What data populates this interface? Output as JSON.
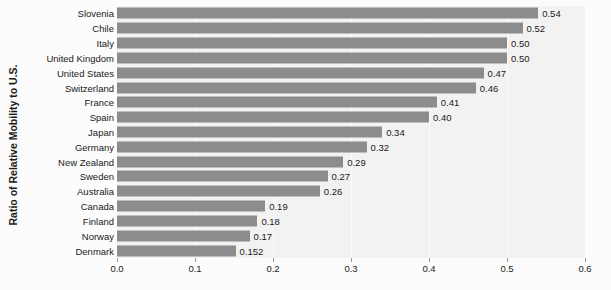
{
  "chart_data": {
    "type": "bar",
    "orientation": "horizontal",
    "title": "",
    "xlabel": "",
    "ylabel": "Ratio of Relative Mobility to U.S.",
    "xlim": [
      0.0,
      0.6
    ],
    "xticks": [
      "0.0",
      "0.1",
      "0.2",
      "0.3",
      "0.4",
      "0.5",
      "0.6"
    ],
    "xtick_values": [
      0.0,
      0.1,
      0.2,
      0.3,
      0.4,
      0.5,
      0.6
    ],
    "grid": true,
    "legend": "none",
    "bar_color": "#8c8c8c",
    "plot_background": "#f2f2f2",
    "figure_background": "#fcfcfc",
    "categories": [
      "Slovenia",
      "Chile",
      "Italy",
      "United Kingdom",
      "United States",
      "Switzerland",
      "France",
      "Spain",
      "Japan",
      "Germany",
      "New Zealand",
      "Sweden",
      "Australia",
      "Canada",
      "Finland",
      "Norway",
      "Denmark"
    ],
    "values": [
      0.54,
      0.52,
      0.5,
      0.5,
      0.47,
      0.46,
      0.41,
      0.4,
      0.34,
      0.32,
      0.29,
      0.27,
      0.26,
      0.19,
      0.18,
      0.17,
      0.152
    ],
    "value_labels": [
      "0.54",
      "0.52",
      "0.50",
      "0.50",
      "0.47",
      "0.46",
      "0.41",
      "0.40",
      "0.34",
      "0.32",
      "0.29",
      "0.27",
      "0.26",
      "0.19",
      "0.18",
      "0.17",
      "0.152"
    ]
  }
}
